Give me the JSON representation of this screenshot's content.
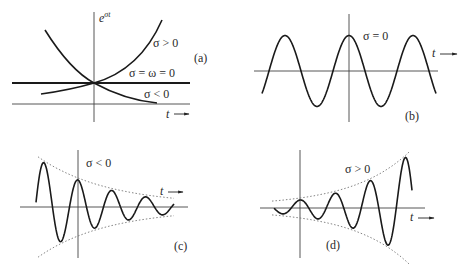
{
  "panels": {
    "a": {
      "tag": "(a)",
      "y_label_base": "e",
      "y_label_exp": "σt",
      "t_label": "t",
      "curves": [
        {
          "label": "σ > 0",
          "kind": "growing exponential"
        },
        {
          "label": "σ = ω =  0",
          "kind": "constant"
        },
        {
          "label": "σ < 0",
          "kind": "decaying exponential"
        }
      ]
    },
    "b": {
      "tag": "(b)",
      "label": "σ =  0",
      "t_label": "t",
      "kind": "undamped sinusoid"
    },
    "c": {
      "tag": "(c)",
      "label": "σ < 0",
      "t_label": "t",
      "kind": "decaying sinusoid with dotted envelope"
    },
    "d": {
      "tag": "(d)",
      "label": "σ > 0",
      "t_label": "t",
      "kind": "growing sinusoid with dotted envelope"
    }
  },
  "colors": {
    "curve": "#1a1a1a",
    "axis": "#333333",
    "envelope": "#777777"
  }
}
